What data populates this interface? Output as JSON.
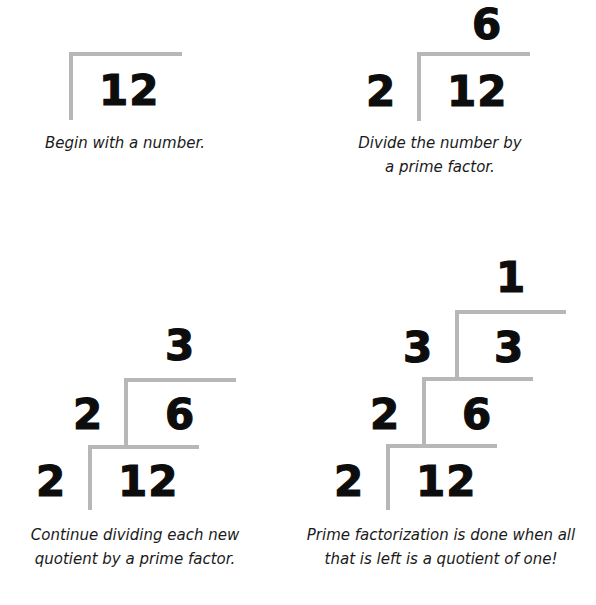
{
  "panels": [
    {
      "id": "step-1",
      "caption": [
        "Begin with a number."
      ],
      "dividend": "12"
    },
    {
      "id": "step-2",
      "caption": [
        "Divide the number by",
        "a prime factor."
      ],
      "quotient": "6",
      "divisor": "2",
      "dividend": "12"
    },
    {
      "id": "step-3",
      "caption": [
        "Continue dividing each new",
        "quotient by a prime factor."
      ],
      "rows": [
        {
          "divisor": "2",
          "dividend": "12"
        },
        {
          "divisor": "2",
          "dividend": "6"
        }
      ],
      "quotient": "3"
    },
    {
      "id": "step-4",
      "caption": [
        "Prime factorization is done when all",
        "that is left is a quotient of one!"
      ],
      "rows": [
        {
          "divisor": "2",
          "dividend": "12"
        },
        {
          "divisor": "2",
          "dividend": "6"
        },
        {
          "divisor": "3",
          "dividend": "3"
        }
      ],
      "quotient": "1"
    }
  ],
  "colors": {
    "bracket": "#b7b7b7",
    "numbers": "#0d0d0d",
    "background": "#ffffff"
  }
}
